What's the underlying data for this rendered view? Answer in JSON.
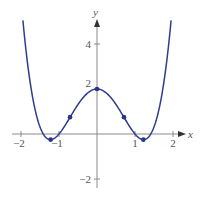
{
  "chart_data": {
    "type": "line",
    "title": "",
    "function": "y = x^4 - 3x^2 + 2",
    "xlabel": "x",
    "ylabel": "y",
    "xlim": [
      -2,
      2
    ],
    "ylim": [
      -2,
      5
    ],
    "grid": false,
    "legend": null,
    "x_ticks": [
      {
        "value": -2,
        "label": "−2"
      },
      {
        "value": -1,
        "label": "−1"
      },
      {
        "value": 1,
        "label": "1"
      },
      {
        "value": 2,
        "label": "2"
      }
    ],
    "y_ticks": [
      {
        "value": 4,
        "label": "4"
      },
      {
        "value": 2,
        "label": "2"
      },
      {
        "value": -2,
        "label": "−2"
      }
    ],
    "marked_points": [
      {
        "x": -1.22,
        "y": -0.25,
        "kind": "local minimum"
      },
      {
        "x": -0.71,
        "y": 0.75,
        "kind": "inflection point"
      },
      {
        "x": 0,
        "y": 2,
        "kind": "local maximum"
      },
      {
        "x": 0.71,
        "y": 0.75,
        "kind": "inflection point"
      },
      {
        "x": 1.22,
        "y": -0.25,
        "kind": "local minimum"
      }
    ],
    "series": [
      {
        "name": "f(x)",
        "x": [
          -1.95,
          -1.8,
          -1.6,
          -1.414,
          -1.22,
          -1.0,
          -0.71,
          -0.4,
          0,
          0.4,
          0.71,
          1.0,
          1.22,
          1.414,
          1.6,
          1.8,
          1.95
        ],
        "values": [
          5.05,
          3.78,
          0.87,
          0.0,
          -0.25,
          0.0,
          0.75,
          1.55,
          2.0,
          1.55,
          0.75,
          0.0,
          -0.25,
          0.0,
          0.87,
          3.78,
          5.05
        ]
      }
    ],
    "colors": {
      "curve": "#2f3c8f",
      "points": "#2a3588",
      "axis": "#8a8a8a",
      "labels": "#555555"
    }
  }
}
